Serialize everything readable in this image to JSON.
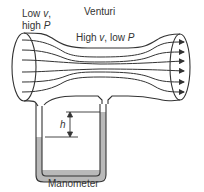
{
  "title": "Venturi",
  "inlet_label": {
    "line1_text": "Low ",
    "line1_var": "v",
    "line1_suffix": ",",
    "line2_text": "high ",
    "line2_var": "P"
  },
  "throat_label": {
    "text1": "High ",
    "var1": "v",
    "text2": ", low ",
    "var2": "P"
  },
  "height_label": "h",
  "manometer_label": "Manometer",
  "colors": {
    "stroke": "#333333",
    "fluid": "#b9b9b9",
    "background": "#ffffff"
  }
}
